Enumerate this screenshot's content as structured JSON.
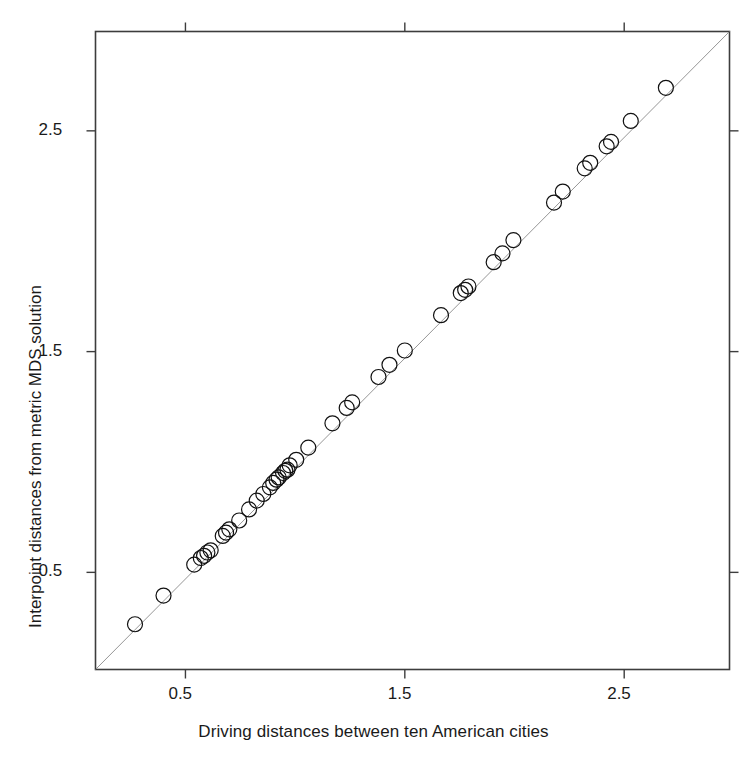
{
  "chart_data": {
    "type": "scatter",
    "title": "",
    "xlabel": "Driving distances between ten American cities",
    "ylabel": "Interpoint distances from metric MDS solution",
    "xlim": [
      0.09,
      2.98
    ],
    "ylim": [
      0.06,
      2.95
    ],
    "xticks": [
      0.5,
      1.5,
      2.5
    ],
    "yticks": [
      0.5,
      1.5,
      2.5
    ],
    "xticklabels": [
      "0.5",
      "1.5",
      "2.5"
    ],
    "yticklabels": [
      "0.5",
      "1.5",
      "2.5"
    ],
    "grid": false,
    "legend": null,
    "marker": {
      "shape": "open-circle",
      "radius_px": 7.5,
      "stroke": "#111111",
      "stroke_width": 1.2,
      "fill": "none"
    },
    "reference_line": {
      "type": "identity",
      "label": "y = x",
      "stroke": "#8a8a8a",
      "stroke_width": 0.9,
      "from": [
        0.09,
        0.06
      ],
      "to": [
        2.98,
        2.95
      ]
    },
    "n_points": 45,
    "series": [
      {
        "name": "city pairs",
        "x": [
          0.27,
          0.4,
          0.54,
          0.57,
          0.585,
          0.6,
          0.615,
          0.67,
          0.685,
          0.7,
          0.745,
          0.79,
          0.825,
          0.855,
          0.885,
          0.9,
          0.915,
          0.925,
          0.945,
          0.955,
          0.965,
          0.975,
          1.005,
          1.06,
          1.17,
          1.235,
          1.26,
          1.38,
          1.43,
          1.5,
          1.665,
          1.755,
          1.775,
          1.79,
          1.905,
          1.945,
          1.995,
          2.18,
          2.22,
          2.32,
          2.345,
          2.42,
          2.44,
          2.53,
          2.69
        ],
        "y": [
          0.265,
          0.395,
          0.535,
          0.565,
          0.575,
          0.59,
          0.6,
          0.665,
          0.68,
          0.695,
          0.735,
          0.785,
          0.825,
          0.855,
          0.885,
          0.905,
          0.92,
          0.93,
          0.95,
          0.96,
          0.965,
          0.985,
          1.01,
          1.065,
          1.175,
          1.245,
          1.27,
          1.385,
          1.44,
          1.505,
          1.665,
          1.765,
          1.78,
          1.795,
          1.905,
          1.945,
          2.005,
          2.175,
          2.225,
          2.33,
          2.355,
          2.43,
          2.45,
          2.545,
          2.695
        ]
      }
    ]
  },
  "axes": {
    "x_title": "Driving distances between ten American cities",
    "y_title": "Interpoint distances from metric MDS solution",
    "x_tick_labels": [
      "0.5",
      "1.5",
      "2.5"
    ],
    "y_tick_labels": [
      "0.5",
      "1.5",
      "2.5"
    ]
  }
}
